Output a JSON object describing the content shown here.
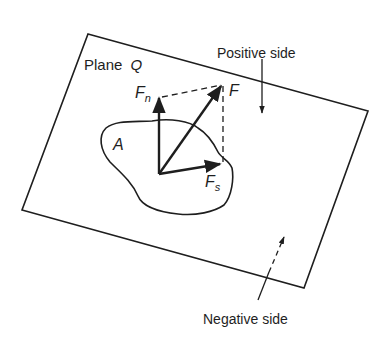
{
  "diagram": {
    "type": "force-decomposition-on-plane",
    "plane_label": "Plane",
    "plane_symbol": "Q",
    "area_label": "A",
    "force_label": "F",
    "normal_component": {
      "symbol": "F",
      "subscript": "n"
    },
    "shear_component": {
      "symbol": "F",
      "subscript": "s"
    },
    "positive_side_label": "Positive side",
    "negative_side_label": "Negative side"
  },
  "colors": {
    "ink": "#1e1e1e",
    "background": "#ffffff"
  }
}
